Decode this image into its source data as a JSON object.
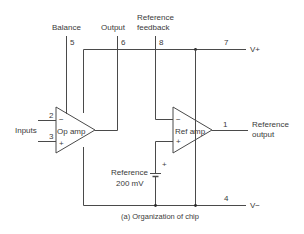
{
  "labels": {
    "balance": "Balance",
    "output": "Output",
    "reference_feedback_line1": "Reference",
    "reference_feedback_line2": "feedback",
    "inputs": "Inputs",
    "v_plus": "V+",
    "v_minus": "V−",
    "reference_output_line1": "Reference",
    "reference_output_line2": "output",
    "reference_source_line1": "Reference",
    "reference_source_line2": "200 mV",
    "caption": "(a)  Organization of chip"
  },
  "pins": {
    "balance": "5",
    "output": "6",
    "reference_feedback": "8",
    "v_plus": "7",
    "inverting_input": "2",
    "noninverting_input": "3",
    "reference_output": "1",
    "v_minus": "4"
  },
  "amplifiers": {
    "op_amp": {
      "label": "Op amp",
      "minus": "−",
      "plus": "+"
    },
    "ref_amp": {
      "label": "Ref amp",
      "minus": "−",
      "plus": "+"
    }
  },
  "battery": {
    "polarity": "+"
  }
}
